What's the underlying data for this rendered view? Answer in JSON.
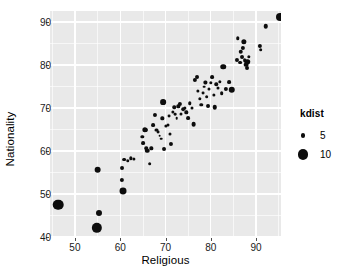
{
  "chart_data": {
    "type": "scatter",
    "title": "",
    "xlabel": "Religious",
    "ylabel": "Nationality",
    "xlim": [
      44.5,
      95.5
    ],
    "ylim": [
      40.0,
      92.6
    ],
    "xticks": [
      50,
      60,
      70,
      80,
      90
    ],
    "yticks": [
      40,
      50,
      60,
      70,
      80,
      90
    ],
    "grid": true,
    "panel_background": "#e9e9e9",
    "gridline_color": "#ffffff",
    "point_color": "#0d0d0d",
    "size_legend": {
      "title": "kdist",
      "position": "right",
      "breaks": [
        5,
        10
      ],
      "labels": [
        "5",
        "10"
      ]
    },
    "series": [
      {
        "name": "countries",
        "x_label": "Religious",
        "y_label": "Nationality",
        "size_label": "kdist",
        "points": [
          {
            "x": 46.3,
            "y": 47.5,
            "kdist": 10.4
          },
          {
            "x": 54.8,
            "y": 42.2,
            "kdist": 10.1
          },
          {
            "x": 55.3,
            "y": 45.6,
            "kdist": 6.0
          },
          {
            "x": 55.0,
            "y": 55.7,
            "kdist": 6.6
          },
          {
            "x": 60.6,
            "y": 50.6,
            "kdist": 6.8
          },
          {
            "x": 60.4,
            "y": 53.3,
            "kdist": 4.6
          },
          {
            "x": 60.5,
            "y": 56.1,
            "kdist": 4.4
          },
          {
            "x": 60.8,
            "y": 58.0,
            "kdist": 4.3
          },
          {
            "x": 61.7,
            "y": 57.8,
            "kdist": 4.1
          },
          {
            "x": 62.4,
            "y": 58.3,
            "kdist": 4.0
          },
          {
            "x": 63.1,
            "y": 58.1,
            "kdist": 3.9
          },
          {
            "x": 64.9,
            "y": 63.3,
            "kdist": 4.0
          },
          {
            "x": 65.1,
            "y": 61.9,
            "kdist": 4.3
          },
          {
            "x": 65.4,
            "y": 65.0,
            "kdist": 5.4
          },
          {
            "x": 65.6,
            "y": 64.9,
            "kdist": 4.6
          },
          {
            "x": 65.8,
            "y": 60.6,
            "kdist": 4.1
          },
          {
            "x": 66.0,
            "y": 60.1,
            "kdist": 4.8
          },
          {
            "x": 66.5,
            "y": 57.1,
            "kdist": 4.2
          },
          {
            "x": 66.9,
            "y": 60.6,
            "kdist": 4.0
          },
          {
            "x": 67.2,
            "y": 66.0,
            "kdist": 4.3
          },
          {
            "x": 67.6,
            "y": 68.3,
            "kdist": 4.5
          },
          {
            "x": 68.0,
            "y": 65.0,
            "kdist": 3.8
          },
          {
            "x": 68.4,
            "y": 64.4,
            "kdist": 3.7
          },
          {
            "x": 68.7,
            "y": 63.6,
            "kdist": 3.6
          },
          {
            "x": 69.0,
            "y": 62.9,
            "kdist": 3.5
          },
          {
            "x": 69.3,
            "y": 67.6,
            "kdist": 4.0
          },
          {
            "x": 69.5,
            "y": 71.4,
            "kdist": 5.8
          },
          {
            "x": 69.7,
            "y": 60.5,
            "kdist": 4.4
          },
          {
            "x": 70.1,
            "y": 65.8,
            "kdist": 3.9
          },
          {
            "x": 70.5,
            "y": 66.0,
            "kdist": 3.8
          },
          {
            "x": 70.8,
            "y": 68.1,
            "kdist": 3.7
          },
          {
            "x": 71.0,
            "y": 63.9,
            "kdist": 3.8
          },
          {
            "x": 71.3,
            "y": 61.7,
            "kdist": 4.5
          },
          {
            "x": 71.6,
            "y": 69.2,
            "kdist": 3.9
          },
          {
            "x": 71.9,
            "y": 70.2,
            "kdist": 4.1
          },
          {
            "x": 72.2,
            "y": 68.6,
            "kdist": 3.6
          },
          {
            "x": 72.5,
            "y": 67.6,
            "kdist": 3.5
          },
          {
            "x": 72.8,
            "y": 70.4,
            "kdist": 4.0
          },
          {
            "x": 73.1,
            "y": 70.9,
            "kdist": 4.6
          },
          {
            "x": 73.5,
            "y": 68.6,
            "kdist": 3.8
          },
          {
            "x": 73.9,
            "y": 69.8,
            "kdist": 4.2
          },
          {
            "x": 74.3,
            "y": 70.1,
            "kdist": 3.9
          },
          {
            "x": 74.6,
            "y": 69.0,
            "kdist": 4.0
          },
          {
            "x": 75.0,
            "y": 67.7,
            "kdist": 4.3
          },
          {
            "x": 75.4,
            "y": 71.1,
            "kdist": 4.1
          },
          {
            "x": 75.8,
            "y": 70.0,
            "kdist": 3.8
          },
          {
            "x": 76.2,
            "y": 66.3,
            "kdist": 5.0
          },
          {
            "x": 76.5,
            "y": 76.6,
            "kdist": 4.6
          },
          {
            "x": 76.9,
            "y": 77.2,
            "kdist": 4.4
          },
          {
            "x": 77.2,
            "y": 74.0,
            "kdist": 3.9
          },
          {
            "x": 77.6,
            "y": 72.2,
            "kdist": 4.0
          },
          {
            "x": 77.9,
            "y": 70.8,
            "kdist": 4.1
          },
          {
            "x": 78.2,
            "y": 73.4,
            "kdist": 3.7
          },
          {
            "x": 78.5,
            "y": 75.0,
            "kdist": 3.6
          },
          {
            "x": 78.8,
            "y": 76.0,
            "kdist": 3.9
          },
          {
            "x": 79.1,
            "y": 72.7,
            "kdist": 4.2
          },
          {
            "x": 79.4,
            "y": 70.4,
            "kdist": 4.4
          },
          {
            "x": 79.7,
            "y": 74.4,
            "kdist": 3.8
          },
          {
            "x": 80.0,
            "y": 75.9,
            "kdist": 4.0
          },
          {
            "x": 80.3,
            "y": 77.2,
            "kdist": 4.3
          },
          {
            "x": 80.6,
            "y": 73.1,
            "kdist": 3.9
          },
          {
            "x": 80.9,
            "y": 70.2,
            "kdist": 4.8
          },
          {
            "x": 81.2,
            "y": 75.5,
            "kdist": 4.1
          },
          {
            "x": 81.6,
            "y": 74.6,
            "kdist": 3.8
          },
          {
            "x": 82.0,
            "y": 76.1,
            "kdist": 4.0
          },
          {
            "x": 82.4,
            "y": 73.5,
            "kdist": 4.2
          },
          {
            "x": 82.8,
            "y": 79.6,
            "kdist": 5.6
          },
          {
            "x": 83.4,
            "y": 74.4,
            "kdist": 4.6
          },
          {
            "x": 84.0,
            "y": 76.0,
            "kdist": 4.3
          },
          {
            "x": 84.6,
            "y": 74.3,
            "kdist": 6.4
          },
          {
            "x": 85.8,
            "y": 81.3,
            "kdist": 4.5
          },
          {
            "x": 86.4,
            "y": 80.6,
            "kdist": 4.3
          },
          {
            "x": 86.6,
            "y": 83.1,
            "kdist": 4.8
          },
          {
            "x": 86.9,
            "y": 81.8,
            "kdist": 4.4
          },
          {
            "x": 87.1,
            "y": 84.0,
            "kdist": 4.6
          },
          {
            "x": 87.3,
            "y": 85.4,
            "kdist": 5.4
          },
          {
            "x": 87.5,
            "y": 81.2,
            "kdist": 4.2
          },
          {
            "x": 87.8,
            "y": 80.1,
            "kdist": 5.0
          },
          {
            "x": 88.0,
            "y": 80.8,
            "kdist": 5.6
          },
          {
            "x": 88.1,
            "y": 79.4,
            "kdist": 4.4
          },
          {
            "x": 88.4,
            "y": 82.0,
            "kdist": 4.0
          },
          {
            "x": 86.0,
            "y": 86.2,
            "kdist": 4.1
          },
          {
            "x": 90.8,
            "y": 84.5,
            "kdist": 4.6
          },
          {
            "x": 91.0,
            "y": 83.6,
            "kdist": 4.2
          },
          {
            "x": 92.1,
            "y": 89.1,
            "kdist": 4.8
          },
          {
            "x": 95.3,
            "y": 91.3,
            "kdist": 7.8
          }
        ]
      }
    ]
  }
}
